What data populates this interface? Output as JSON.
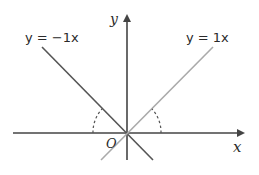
{
  "diagram": {
    "axes": {
      "x_label": "x",
      "y_label": "y",
      "origin_label": "O"
    },
    "lines": [
      {
        "label": "y = −1x",
        "equation": "y = -1x",
        "slope": -1,
        "color": "#555555"
      },
      {
        "label": "y = 1x",
        "equation": "y = 1x",
        "slope": 1,
        "color": "#aaaaaa"
      }
    ],
    "angle_marks": [
      {
        "description": "angle between y = -1x and negative x-axis",
        "style": "dashed"
      },
      {
        "description": "angle between y = 1x and positive x-axis",
        "style": "dashed"
      }
    ],
    "colors": {
      "axis": "#444444",
      "line_negative": "#555555",
      "line_positive": "#aaaaaa",
      "angle_arc": "#555555"
    }
  }
}
